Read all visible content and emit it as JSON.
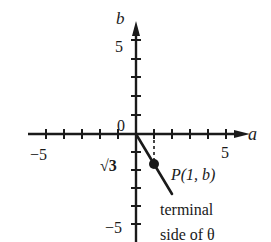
{
  "diagram": {
    "type": "coordinate-plane",
    "axes": {
      "x_label": "a",
      "y_label": "b",
      "origin_label": "0",
      "x_range": [
        -5,
        5
      ],
      "y_range": [
        -5,
        5
      ]
    },
    "tick_labels": {
      "x_neg": "−5",
      "x_pos": "5",
      "y_pos": "5",
      "y_neg": "−5",
      "sqrt3": "√3"
    },
    "point": {
      "label": "P(1, b)",
      "x": 1,
      "y": -1.7320508
    },
    "terminal_side": {
      "label_line1": "terminal",
      "label_line2": "side of θ"
    },
    "colors": {
      "ink": "#1a1a1a",
      "background": "#ffffff"
    }
  }
}
